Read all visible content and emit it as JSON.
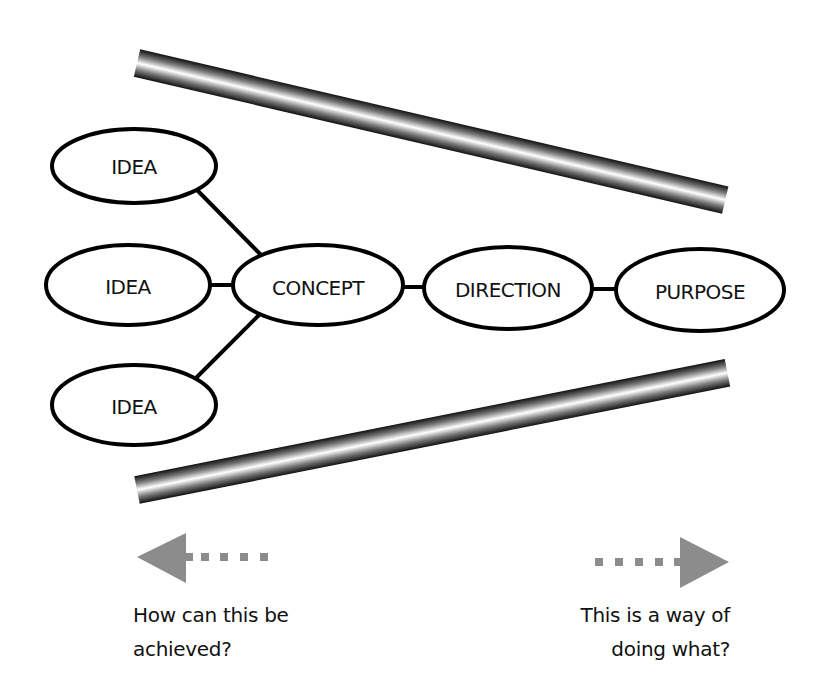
{
  "diagram": {
    "nodes": [
      {
        "id": "idea-top",
        "label": "IDEA",
        "cx": 134,
        "cy": 166,
        "rx": 82,
        "ry": 37
      },
      {
        "id": "idea-middle",
        "label": "IDEA",
        "cx": 128,
        "cy": 285,
        "rx": 82,
        "ry": 40
      },
      {
        "id": "idea-bottom",
        "label": "IDEA",
        "cx": 134,
        "cy": 405,
        "rx": 82,
        "ry": 40
      },
      {
        "id": "concept",
        "label": "CONCEPT",
        "cx": 318,
        "cy": 285,
        "rx": 85,
        "ry": 40
      },
      {
        "id": "direction",
        "label": "DIRECTION",
        "cx": 508,
        "cy": 288,
        "rx": 84,
        "ry": 41
      },
      {
        "id": "purpose",
        "label": "PURPOSE",
        "cx": 700,
        "cy": 290,
        "rx": 84,
        "ry": 41
      }
    ],
    "edges": [
      {
        "from": "idea-top",
        "to": "concept"
      },
      {
        "from": "idea-middle",
        "to": "concept"
      },
      {
        "from": "idea-bottom",
        "to": "concept"
      },
      {
        "from": "concept",
        "to": "direction"
      },
      {
        "from": "direction",
        "to": "purpose"
      }
    ],
    "funnel_bars": {
      "top": {
        "x1": 137,
        "y1": 63,
        "x2": 725,
        "y2": 200
      },
      "bottom": {
        "x1": 137,
        "y1": 490,
        "x2": 727,
        "y2": 373
      }
    },
    "colors": {
      "stroke": "#000000",
      "arrow": "#8c8c8c",
      "bar_dark": "#1a1a1a",
      "bar_light": "#ffffff"
    }
  },
  "arrows": {
    "left": {
      "direction": "left",
      "icon": "arrow-left-icon"
    },
    "right": {
      "direction": "right",
      "icon": "arrow-right-icon"
    }
  },
  "captions": {
    "left": {
      "line1": "How can this be",
      "line2": "achieved?"
    },
    "right": {
      "line1": "This is a way of",
      "line2": "doing what?"
    }
  }
}
